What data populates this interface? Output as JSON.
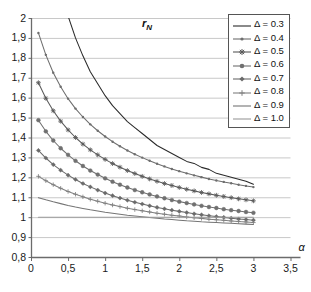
{
  "chart_data": {
    "type": "line",
    "title_display": "r",
    "title_subscript": "N",
    "xlabel": "α",
    "ylabel": "",
    "xlim": [
      0,
      3.5
    ],
    "ylim": [
      0.8,
      2.0
    ],
    "grid": "horizontal",
    "legend_position": "top-right",
    "x_ticks": [
      0,
      0.5,
      1,
      1.5,
      2,
      2.5,
      3,
      3.5
    ],
    "x_tick_labels": [
      "0",
      "0,5",
      "1",
      "1,5",
      "2",
      "2,5",
      "3",
      "3,5"
    ],
    "y_ticks": [
      0.8,
      0.9,
      1.0,
      1.1,
      1.2,
      1.3,
      1.4,
      1.5,
      1.6,
      1.7,
      1.8,
      1.9,
      2.0
    ],
    "y_tick_labels": [
      "0,8",
      "0,9",
      "1",
      "1,1",
      "1,2",
      "1,3",
      "1,4",
      "1,5",
      "1,6",
      "1,7",
      "1,8",
      "1,9",
      "2"
    ],
    "x": [
      0.1,
      0.2,
      0.3,
      0.4,
      0.5,
      0.6,
      0.7,
      0.8,
      0.9,
      1.0,
      1.1,
      1.2,
      1.3,
      1.4,
      1.5,
      1.6,
      1.7,
      1.8,
      1.9,
      2.0,
      2.1,
      2.2,
      2.3,
      2.4,
      2.5,
      2.6,
      2.7,
      2.8,
      2.9,
      3.0
    ],
    "series": [
      {
        "name": "Δ = 0.3",
        "delta": 0.3,
        "marker": "none",
        "color": "#2b2b2b",
        "values": [
          3.05,
          2.62,
          2.35,
          2.16,
          2.01,
          1.9,
          1.81,
          1.73,
          1.67,
          1.61,
          1.56,
          1.52,
          1.48,
          1.45,
          1.42,
          1.39,
          1.36,
          1.34,
          1.32,
          1.3,
          1.28,
          1.27,
          1.25,
          1.24,
          1.22,
          1.21,
          1.2,
          1.19,
          1.18,
          1.165
        ]
      },
      {
        "name": "Δ = 0.4",
        "delta": 0.4,
        "marker": "dot",
        "color": "#6e6e6e",
        "values": [
          1.925,
          1.815,
          1.725,
          1.655,
          1.595,
          1.545,
          1.503,
          1.466,
          1.434,
          1.405,
          1.379,
          1.356,
          1.335,
          1.316,
          1.299,
          1.283,
          1.268,
          1.255,
          1.242,
          1.231,
          1.22,
          1.21,
          1.201,
          1.192,
          1.184,
          1.177,
          1.17,
          1.163,
          1.157,
          1.151
        ]
      },
      {
        "name": "Δ = 0.5",
        "delta": 0.5,
        "marker": "star",
        "color": "#5a5a5a",
        "values": [
          1.675,
          1.597,
          1.534,
          1.482,
          1.438,
          1.4,
          1.367,
          1.338,
          1.313,
          1.29,
          1.269,
          1.251,
          1.234,
          1.219,
          1.205,
          1.192,
          1.18,
          1.169,
          1.159,
          1.149,
          1.14,
          1.132,
          1.124,
          1.117,
          1.11,
          1.104,
          1.098,
          1.092,
          1.087,
          1.082
        ]
      },
      {
        "name": "Δ = 0.6",
        "delta": 0.6,
        "marker": "circle",
        "color": "#707070",
        "values": [
          1.487,
          1.431,
          1.385,
          1.346,
          1.313,
          1.283,
          1.257,
          1.234,
          1.214,
          1.195,
          1.178,
          1.163,
          1.149,
          1.136,
          1.125,
          1.114,
          1.104,
          1.095,
          1.086,
          1.078,
          1.071,
          1.064,
          1.057,
          1.051,
          1.046,
          1.04,
          1.035,
          1.031,
          1.026,
          1.022
        ]
      },
      {
        "name": "Δ = 0.7",
        "delta": 0.7,
        "marker": "diamond",
        "color": "#6a6a6a",
        "values": [
          1.335,
          1.297,
          1.264,
          1.236,
          1.211,
          1.189,
          1.169,
          1.152,
          1.136,
          1.121,
          1.108,
          1.096,
          1.085,
          1.075,
          1.066,
          1.057,
          1.049,
          1.042,
          1.035,
          1.029,
          1.023,
          1.017,
          1.012,
          1.007,
          1.003,
          0.999,
          0.995,
          0.991,
          0.988,
          0.985
        ]
      },
      {
        "name": "Δ = 0.8",
        "delta": 0.8,
        "marker": "plus",
        "color": "#808080",
        "values": [
          1.205,
          1.183,
          1.163,
          1.145,
          1.129,
          1.115,
          1.102,
          1.09,
          1.08,
          1.07,
          1.061,
          1.053,
          1.045,
          1.038,
          1.032,
          1.026,
          1.02,
          1.015,
          1.01,
          1.006,
          1.001,
          0.997,
          0.994,
          0.99,
          0.987,
          0.984,
          0.981,
          0.978,
          0.976,
          0.973
        ]
      },
      {
        "name": "Δ = 0.9",
        "delta": 0.9,
        "marker": "none",
        "color": "#757575",
        "values": [
          1.098,
          1.087,
          1.077,
          1.068,
          1.059,
          1.051,
          1.044,
          1.037,
          1.031,
          1.025,
          1.02,
          1.015,
          1.01,
          1.006,
          1.002,
          0.998,
          0.995,
          0.991,
          0.988,
          0.985,
          0.982,
          0.98,
          0.977,
          0.975,
          0.973,
          0.971,
          0.969,
          0.967,
          0.965,
          0.963
        ]
      },
      {
        "name": "Δ = 1.0",
        "delta": 1.0,
        "marker": "none",
        "color": "#9a9a9a",
        "values": [
          1.0,
          1.0,
          1.0,
          1.0,
          1.0,
          1.0,
          1.0,
          1.0,
          1.0,
          1.0,
          1.0,
          1.0,
          1.0,
          1.0,
          1.0,
          1.0,
          1.0,
          1.0,
          1.0,
          1.0,
          1.0,
          1.0,
          1.0,
          1.0,
          1.0,
          1.0,
          1.0,
          1.0,
          1.0,
          1.0
        ]
      }
    ]
  },
  "legend": {
    "items": [
      {
        "label": "Δ = 0.3"
      },
      {
        "label": "Δ = 0.4"
      },
      {
        "label": "Δ = 0.5"
      },
      {
        "label": "Δ = 0.6"
      },
      {
        "label": "Δ = 0.7"
      },
      {
        "label": "Δ = 0.8"
      },
      {
        "label": "Δ = 0.9"
      },
      {
        "label": "Δ = 1.0"
      }
    ]
  },
  "colors": {
    "background": "#ffffff",
    "grid": "#c8c8c8",
    "axis": "#6b6b6b",
    "text": "#111111",
    "legend_border": "#555555"
  }
}
